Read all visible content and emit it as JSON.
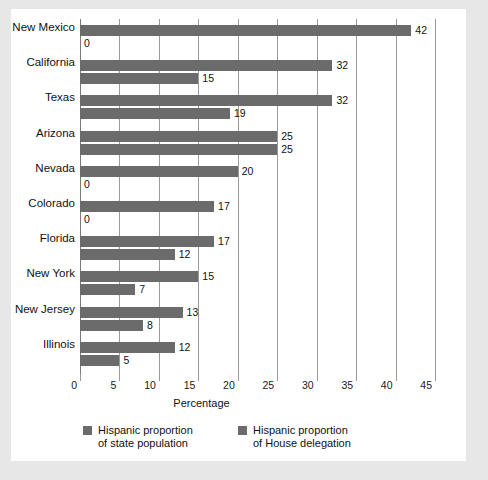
{
  "chart_data": {
    "type": "bar",
    "orientation": "horizontal",
    "title": "",
    "xlabel": "Percentage",
    "ylabel": "",
    "xlim": [
      0,
      45
    ],
    "xticks": [
      0,
      5,
      10,
      15,
      20,
      25,
      30,
      35,
      40,
      45
    ],
    "grid": true,
    "legend_position": "bottom",
    "categories": [
      "New Mexico",
      "California",
      "Texas",
      "Arizona",
      "Nevada",
      "Colorado",
      "Florida",
      "New York",
      "New Jersey",
      "Illinois"
    ],
    "series": [
      {
        "name": "Hispanic proportion\nof state population",
        "values": [
          42,
          32,
          32,
          25,
          20,
          17,
          17,
          15,
          13,
          12
        ]
      },
      {
        "name": "Hispanic proportion\nof House delegation",
        "values": [
          0,
          15,
          19,
          25,
          0,
          0,
          12,
          7,
          8,
          5
        ]
      }
    ],
    "bar_color": "#6b6b6b",
    "background": "#ffffff",
    "page_background": "#e7e7e7"
  },
  "axis": {
    "tick_labels": [
      "0",
      "5",
      "10",
      "15",
      "20",
      "25",
      "30",
      "35",
      "40",
      "45"
    ],
    "x_title": "Percentage"
  },
  "legend": {
    "items": [
      {
        "line1": "Hispanic proportion",
        "line2": "of state population",
        "color": "#6b6b6b"
      },
      {
        "line1": "Hispanic proportion",
        "line2": "of House delegation",
        "color": "#6b6b6b"
      }
    ]
  },
  "rows": [
    {
      "state": "New Mexico",
      "pop": 42,
      "house": 0,
      "pop_text": "42",
      "house_text": "0"
    },
    {
      "state": "California",
      "pop": 32,
      "house": 15,
      "pop_text": "32",
      "house_text": "15"
    },
    {
      "state": "Texas",
      "pop": 32,
      "house": 19,
      "pop_text": "32",
      "house_text": "19"
    },
    {
      "state": "Arizona",
      "pop": 25,
      "house": 25,
      "pop_text": "25",
      "house_text": "25"
    },
    {
      "state": "Nevada",
      "pop": 20,
      "house": 0,
      "pop_text": "20",
      "house_text": "0"
    },
    {
      "state": "Colorado",
      "pop": 17,
      "house": 0,
      "pop_text": "17",
      "house_text": "0"
    },
    {
      "state": "Florida",
      "pop": 17,
      "house": 12,
      "pop_text": "17",
      "house_text": "12"
    },
    {
      "state": "New York",
      "pop": 15,
      "house": 7,
      "pop_text": "15",
      "house_text": "7"
    },
    {
      "state": "New Jersey",
      "pop": 13,
      "house": 8,
      "pop_text": "13",
      "house_text": "8"
    },
    {
      "state": "Illinois",
      "pop": 12,
      "house": 5,
      "pop_text": "12",
      "house_text": "5"
    }
  ]
}
